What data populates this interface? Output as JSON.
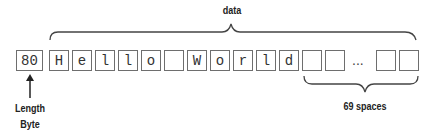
{
  "diagram": {
    "top_label": "data",
    "length_byte": {
      "value": "80",
      "label_line1": "Length",
      "label_line2": "Byte"
    },
    "data_cells": [
      "H",
      "e",
      "l",
      "l",
      "o",
      " ",
      "W",
      "o",
      "r",
      "l",
      "d",
      " ",
      " "
    ],
    "ellipsis": "...",
    "trailing_cells": [
      " ",
      " "
    ],
    "bottom_label": "69 spaces"
  }
}
